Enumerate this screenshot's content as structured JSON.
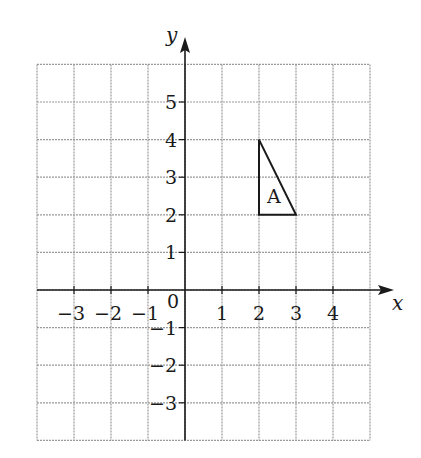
{
  "chart_data": {
    "type": "scatter",
    "title": "",
    "xlabel": "x",
    "ylabel": "y",
    "xlim": [
      -4,
      5
    ],
    "ylim": [
      -4,
      6
    ],
    "grid": true,
    "x_ticks": [
      "-3",
      "-2",
      "-1",
      "1",
      "2",
      "3",
      "4"
    ],
    "x_tick_values": [
      -3,
      -2,
      -1,
      1,
      2,
      3,
      4
    ],
    "y_ticks": [
      "5",
      "4",
      "3",
      "2",
      "1",
      "-1",
      "-2",
      "-3"
    ],
    "y_tick_values": [
      5,
      4,
      3,
      2,
      1,
      -1,
      -2,
      -3
    ],
    "origin_label": "0",
    "shapes": [
      {
        "name": "A",
        "type": "triangle",
        "vertices": [
          [
            2,
            4
          ],
          [
            2,
            2
          ],
          [
            3,
            2
          ]
        ],
        "label": "A",
        "label_position": [
          2.4,
          2.5
        ]
      }
    ]
  },
  "colors": {
    "grid": "#9a9a9a",
    "axis": "#1a1a1a",
    "shape": "#1a1a1a",
    "background": "#ffffff"
  }
}
